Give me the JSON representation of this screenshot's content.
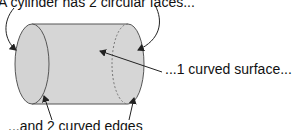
{
  "diagram": {
    "labels": {
      "top": "A cylinder has 2 circular faces...",
      "right": "...1 curved surface...",
      "bottom": "...and 2 curved edges"
    },
    "shape": "cylinder",
    "colors": {
      "fill": "#d6d6d6",
      "stroke": "#555555",
      "arrow": "#222222",
      "text": "#111111"
    }
  }
}
